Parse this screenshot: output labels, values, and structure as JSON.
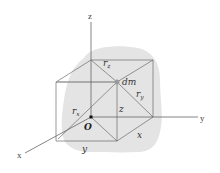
{
  "diagram": {
    "type": "3d-coordinate-mass-element",
    "axes": {
      "x_label": "x",
      "y_label": "y",
      "z_label": "z"
    },
    "origin_label": "O",
    "mass_element_label": "dm",
    "distances": {
      "r_x": {
        "base": "r",
        "sub": "x"
      },
      "r_y": {
        "base": "r",
        "sub": "y"
      },
      "r_z": {
        "base": "r",
        "sub": "z"
      }
    },
    "coordinates": {
      "x": "x",
      "y": "y",
      "z": "z"
    },
    "colors": {
      "body_fill": "#e4e4e4",
      "line": "#555555",
      "axis": "#666666",
      "dm_point": "#9a9a9a",
      "origin_point": "#111111"
    }
  }
}
